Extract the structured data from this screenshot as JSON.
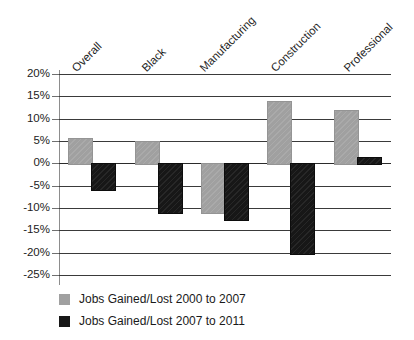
{
  "chart_data": {
    "type": "bar",
    "title": "",
    "xlabel": "",
    "ylabel": "",
    "ylim": [
      -25,
      20
    ],
    "grid": true,
    "legend_position": "bottom-left",
    "categories": [
      "Overall",
      "Black",
      "Manufacturing",
      "Construction",
      "Professional"
    ],
    "ytick_labels": [
      "20%",
      "15%",
      "10%",
      "5%",
      "0%",
      "-5%",
      "-10%",
      "-15%",
      "-20%",
      "-25%"
    ],
    "ytick_values": [
      20,
      15,
      10,
      5,
      0,
      -5,
      -10,
      -15,
      -20,
      -25
    ],
    "series": [
      {
        "name": "Jobs Gained/Lost 2000 to 2007",
        "color": "#a0a0a0",
        "values": [
          5.7,
          5.0,
          -11.0,
          14.0,
          12.0
        ]
      },
      {
        "name": "Jobs Gained/Lost 2007 to 2011",
        "color": "#171717",
        "values": [
          -5.8,
          -11.0,
          -12.5,
          -20.0,
          1.5
        ]
      }
    ]
  },
  "axis": {
    "ticks": [
      {
        "label": "20%"
      },
      {
        "label": "15%"
      },
      {
        "label": "10%"
      },
      {
        "label": "5%"
      },
      {
        "label": "0%"
      },
      {
        "label": "-5%"
      },
      {
        "label": "-10%"
      },
      {
        "label": "-15%"
      },
      {
        "label": "-20%"
      },
      {
        "label": "-25%"
      }
    ]
  },
  "categories": [
    {
      "label": "Overall"
    },
    {
      "label": "Black"
    },
    {
      "label": "Manufacturing"
    },
    {
      "label": "Construction"
    },
    {
      "label": "Professional"
    }
  ],
  "legend": {
    "items": [
      {
        "label": "Jobs Gained/Lost 2000 to 2007",
        "swatch": "gray-swatch-icon"
      },
      {
        "label": "Jobs Gained/Lost 2007 to 2011",
        "swatch": "black-swatch-icon"
      }
    ]
  }
}
